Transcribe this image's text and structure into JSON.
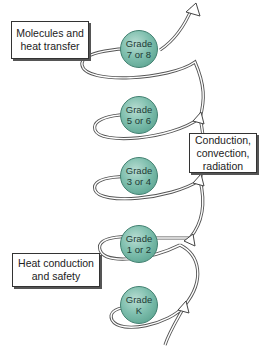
{
  "diagram": {
    "type": "spiral-curriculum",
    "grades": [
      {
        "line1": "Grade",
        "line2": "7 or 8"
      },
      {
        "line1": "Grade",
        "line2": "5 or 6"
      },
      {
        "line1": "Grade",
        "line2": "3 or 4"
      },
      {
        "line1": "Grade",
        "line2": "1 or 2"
      },
      {
        "line1": "Grade",
        "line2": "K"
      }
    ],
    "callouts": {
      "top_left": {
        "line1": "Molecules and",
        "line2": "heat transfer"
      },
      "right": {
        "line1": "Conduction,",
        "line2": "convection,",
        "line3": "radiation"
      },
      "bottom_left": {
        "line1": "Heat conduction",
        "line2": "and safety"
      }
    },
    "colors": {
      "sphere": "#7fbfae",
      "sphere_border": "#3f7f6f",
      "spiral": "#555555"
    }
  }
}
